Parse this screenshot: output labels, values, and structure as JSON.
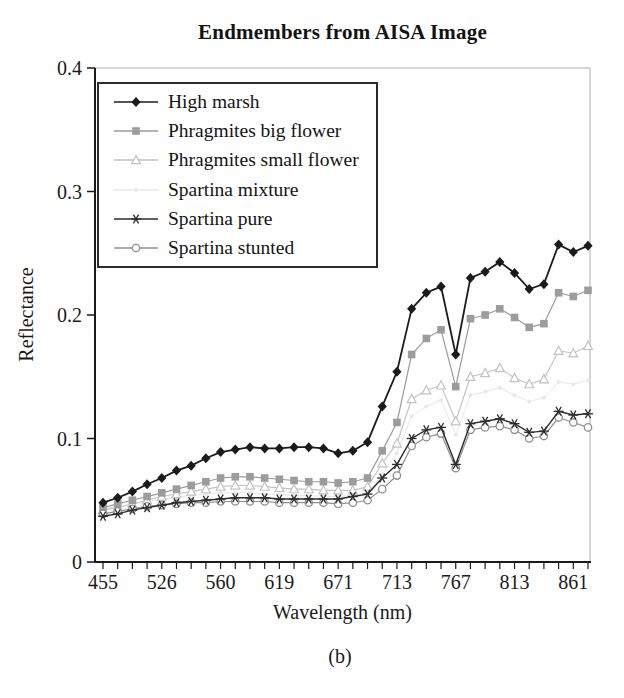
{
  "figure": {
    "title": "Endmembers from AISA Image",
    "caption": "(b)"
  },
  "chart_data": {
    "type": "line",
    "title": "Endmembers from AISA Image",
    "xlabel": "Wavelength (nm)",
    "ylabel": "Reflectance",
    "ylim": [
      0,
      0.4
    ],
    "grid": false,
    "legend_position": "upper-left-inside",
    "y_ticks": [
      0,
      0.1,
      0.2,
      0.3,
      0.4
    ],
    "y_tick_labels": [
      "0",
      "0.1",
      "0.2",
      "0.3",
      "0.4"
    ],
    "x_tick_labels": [
      "455",
      "526",
      "560",
      "619",
      "671",
      "713",
      "767",
      "813",
      "861"
    ],
    "x_label_every": 4,
    "n_points": 34,
    "frame_color": "#c9c9c9",
    "axis_color": "#1a1a1a",
    "series": [
      {
        "name": "High marsh",
        "marker": "diamond",
        "color": "#1b1b1b",
        "line_width": 1.8,
        "values": [
          0.048,
          0.052,
          0.057,
          0.063,
          0.068,
          0.074,
          0.078,
          0.084,
          0.089,
          0.091,
          0.093,
          0.092,
          0.092,
          0.093,
          0.093,
          0.092,
          0.088,
          0.09,
          0.097,
          0.126,
          0.154,
          0.205,
          0.218,
          0.223,
          0.168,
          0.23,
          0.235,
          0.243,
          0.234,
          0.221,
          0.225,
          0.257,
          0.251,
          0.256
        ]
      },
      {
        "name": "Phragmites big flower",
        "marker": "square",
        "color": "#9c9c9c",
        "line_width": 1.2,
        "values": [
          0.044,
          0.047,
          0.05,
          0.053,
          0.056,
          0.059,
          0.062,
          0.065,
          0.068,
          0.069,
          0.069,
          0.068,
          0.067,
          0.066,
          0.065,
          0.065,
          0.064,
          0.065,
          0.068,
          0.09,
          0.113,
          0.168,
          0.181,
          0.188,
          0.142,
          0.197,
          0.2,
          0.205,
          0.198,
          0.19,
          0.193,
          0.218,
          0.215,
          0.22
        ]
      },
      {
        "name": "Phragmites small flower",
        "marker": "triangle-open",
        "color": "#c2c2c2",
        "line_width": 1.1,
        "values": [
          0.042,
          0.044,
          0.047,
          0.05,
          0.053,
          0.055,
          0.057,
          0.059,
          0.061,
          0.062,
          0.062,
          0.061,
          0.06,
          0.059,
          0.059,
          0.058,
          0.058,
          0.058,
          0.061,
          0.08,
          0.096,
          0.132,
          0.139,
          0.143,
          0.114,
          0.15,
          0.153,
          0.157,
          0.149,
          0.144,
          0.148,
          0.171,
          0.169,
          0.175
        ]
      },
      {
        "name": "Spartina mixture",
        "marker": "dot",
        "color": "#e8e8e8",
        "line_width": 1.0,
        "values": [
          0.043,
          0.045,
          0.047,
          0.049,
          0.051,
          0.052,
          0.054,
          0.055,
          0.056,
          0.056,
          0.056,
          0.055,
          0.055,
          0.054,
          0.054,
          0.053,
          0.053,
          0.054,
          0.056,
          0.071,
          0.088,
          0.118,
          0.126,
          0.131,
          0.103,
          0.135,
          0.138,
          0.141,
          0.135,
          0.13,
          0.133,
          0.146,
          0.144,
          0.147
        ]
      },
      {
        "name": "Spartina pure",
        "marker": "asterisk",
        "color": "#2d2d2d",
        "line_width": 1.4,
        "values": [
          0.037,
          0.039,
          0.042,
          0.044,
          0.046,
          0.048,
          0.049,
          0.05,
          0.051,
          0.052,
          0.052,
          0.052,
          0.051,
          0.051,
          0.051,
          0.051,
          0.051,
          0.053,
          0.055,
          0.068,
          0.079,
          0.1,
          0.107,
          0.109,
          0.079,
          0.112,
          0.114,
          0.116,
          0.112,
          0.105,
          0.106,
          0.122,
          0.119,
          0.12
        ]
      },
      {
        "name": "Spartina stunted",
        "marker": "circle-open",
        "color": "#8f8f8f",
        "line_width": 1.2,
        "values": [
          0.039,
          0.041,
          0.043,
          0.045,
          0.046,
          0.047,
          0.048,
          0.048,
          0.049,
          0.049,
          0.049,
          0.049,
          0.048,
          0.048,
          0.048,
          0.048,
          0.047,
          0.048,
          0.05,
          0.059,
          0.07,
          0.094,
          0.101,
          0.104,
          0.076,
          0.107,
          0.109,
          0.11,
          0.107,
          0.1,
          0.102,
          0.117,
          0.113,
          0.109
        ]
      }
    ]
  }
}
